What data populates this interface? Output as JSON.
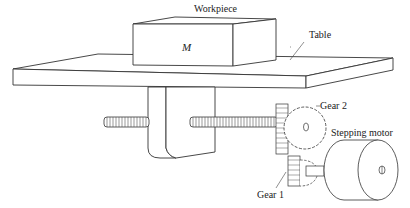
{
  "diagram": {
    "labels": {
      "workpiece": "Workpiece",
      "mass": "M",
      "table": "Table",
      "gear2": "Gear 2",
      "gear1": "Gear 1",
      "stepping_motor": "Stepping motor"
    },
    "components": [
      {
        "id": "workpiece",
        "label": "Workpiece",
        "symbol": "M"
      },
      {
        "id": "table",
        "label": "Table"
      },
      {
        "id": "lead-screw",
        "label": ""
      },
      {
        "id": "bracket",
        "label": ""
      },
      {
        "id": "gear-2",
        "label": "Gear 2"
      },
      {
        "id": "gear-1",
        "label": "Gear 1"
      },
      {
        "id": "stepping-motor",
        "label": "Stepping motor"
      }
    ],
    "colors": {
      "line": "#333333",
      "background": "#ffffff"
    }
  }
}
